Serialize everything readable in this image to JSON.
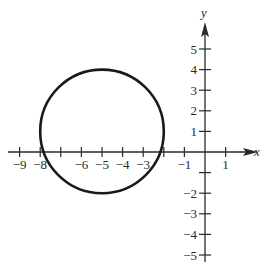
{
  "chart_data": {
    "type": "line",
    "title": "",
    "xlabel": "x",
    "ylabel": "y",
    "x_tick_labels": [
      "-9",
      "-8",
      "-6",
      "-5",
      "-4",
      "-3",
      "-1",
      "1"
    ],
    "x_ticks": [
      -9,
      -8,
      -7,
      -6,
      -5,
      -4,
      -3,
      -2,
      -1,
      1
    ],
    "y_tick_labels": [
      "5",
      "4",
      "3",
      "2",
      "1",
      "-2",
      "-3",
      "-4",
      "-5"
    ],
    "y_ticks": [
      5,
      4,
      3,
      2,
      1,
      -1,
      -2,
      -3,
      -4,
      -5
    ],
    "xlim": [
      -9.8,
      2.2
    ],
    "ylim": [
      -5.2,
      6.3
    ],
    "grid": false,
    "series": [
      {
        "name": "circle",
        "shape": "circle",
        "center": [
          -5,
          1
        ],
        "radius": 3,
        "equation": "(x+5)^2 + (y-1)^2 = 9"
      }
    ]
  },
  "axes": {
    "x_label": "x",
    "y_label": "y",
    "color": "#2a2a2a"
  }
}
